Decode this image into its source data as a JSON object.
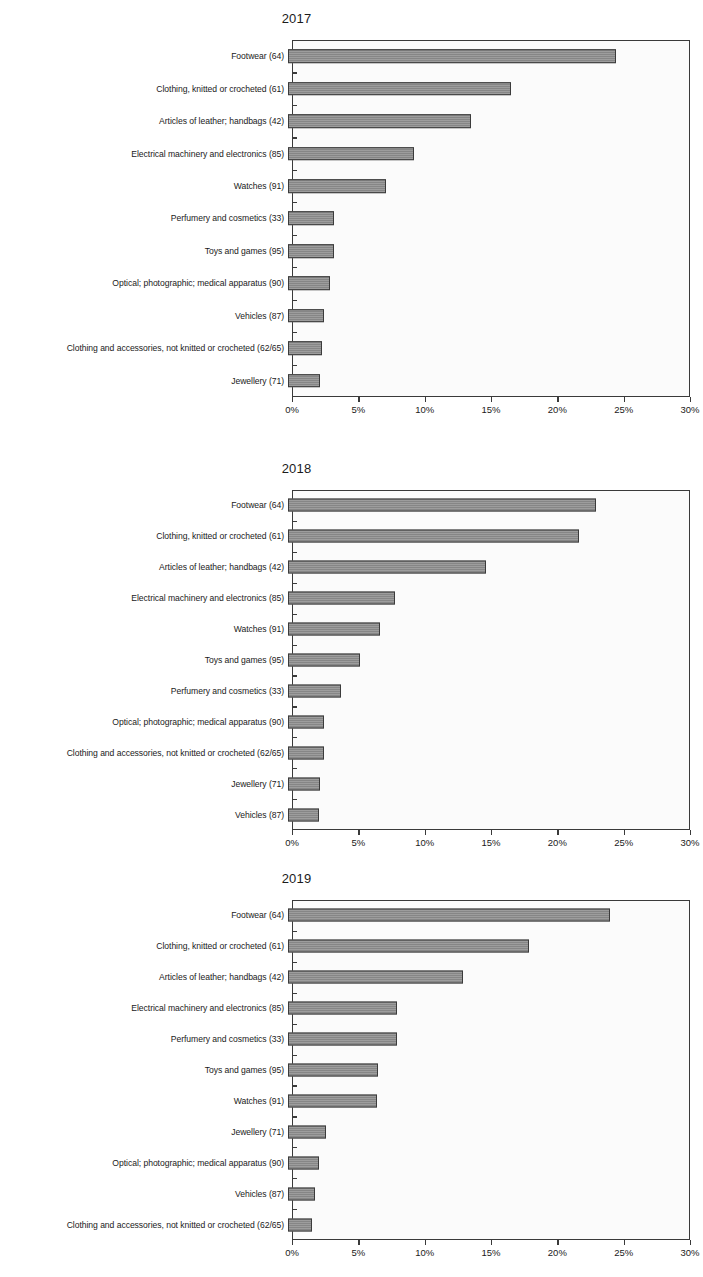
{
  "page": {
    "width": 703,
    "height": 1277,
    "background": "#ffffff",
    "bar_color": "#8d8d8d",
    "bar_border_color": "#3b3b3b",
    "axis_color": "#3a3a3a"
  },
  "axis": {
    "tick_labels": [
      "0%",
      "5%",
      "10%",
      "15%",
      "20%",
      "25%",
      "30%"
    ],
    "tick_values": [
      0,
      5,
      10,
      15,
      20,
      25,
      30
    ],
    "min": 0,
    "max": 30
  },
  "charts": [
    {
      "title": "2017",
      "categories": [
        "Footwear (64)",
        "Clothing, knitted or crocheted (61)",
        "Articles of leather; handbags (42)",
        "Electrical machinery and electronics (85)",
        "Watches (91)",
        "Perfumery and cosmetics (33)",
        "Toys and games (95)",
        "Optical; photographic; medical apparatus (90)",
        "Vehicles (87)",
        "Clothing and accessories, not knitted or crocheted (62/65)",
        "Jewellery (71)"
      ],
      "values": [
        24.7,
        16.8,
        13.8,
        9.5,
        7.4,
        3.5,
        3.5,
        3.2,
        2.7,
        2.6,
        2.4
      ]
    },
    {
      "title": "2018",
      "categories": [
        "Footwear (64)",
        "Clothing, knitted or crocheted (61)",
        "Articles of leather; handbags (42)",
        "Electrical machinery and electronics (85)",
        "Watches (91)",
        "Toys and games (95)",
        "Perfumery and cosmetics (33)",
        "Optical; photographic; medical apparatus (90)",
        "Clothing and accessories, not knitted or crocheted (62/65)",
        "Jewellery (71)",
        "Vehicles (87)"
      ],
      "values": [
        23.2,
        21.9,
        14.9,
        8.1,
        6.9,
        5.4,
        4.0,
        2.7,
        2.7,
        2.4,
        2.3
      ]
    },
    {
      "title": "2019",
      "categories": [
        "Footwear (64)",
        "Clothing, knitted or crocheted (61)",
        "Articles of leather; handbags (42)",
        "Electrical machinery and electronics (85)",
        "Perfumery and cosmetics (33)",
        "Toys and games (95)",
        "Watches (91)",
        "Jewellery (71)",
        "Optical; photographic; medical apparatus (90)",
        "Vehicles (87)",
        "Clothing and accessories, not knitted or crocheted (62/65)"
      ],
      "values": [
        24.3,
        18.2,
        13.2,
        8.2,
        8.2,
        6.8,
        6.7,
        2.9,
        2.3,
        2.0,
        1.8
      ]
    }
  ],
  "chart_data": [
    {
      "type": "bar",
      "orientation": "horizontal",
      "title": "2017",
      "xlabel": "",
      "ylabel": "",
      "xlim": [
        0,
        30
      ],
      "xticks": [
        0,
        5,
        10,
        15,
        20,
        25,
        30
      ],
      "xtick_labels": [
        "0%",
        "5%",
        "10%",
        "15%",
        "20%",
        "25%",
        "30%"
      ],
      "grid": false,
      "legend": "none",
      "categories": [
        "Footwear (64)",
        "Clothing, knitted or crocheted (61)",
        "Articles of leather; handbags (42)",
        "Electrical machinery and electronics (85)",
        "Watches (91)",
        "Perfumery and cosmetics (33)",
        "Toys and games (95)",
        "Optical; photographic; medical apparatus (90)",
        "Vehicles (87)",
        "Clothing and accessories, not knitted or crocheted (62/65)",
        "Jewellery (71)"
      ],
      "values": [
        24.7,
        16.8,
        13.8,
        9.5,
        7.4,
        3.5,
        3.5,
        3.2,
        2.7,
        2.6,
        2.4
      ]
    },
    {
      "type": "bar",
      "orientation": "horizontal",
      "title": "2018",
      "xlabel": "",
      "ylabel": "",
      "xlim": [
        0,
        30
      ],
      "xticks": [
        0,
        5,
        10,
        15,
        20,
        25,
        30
      ],
      "xtick_labels": [
        "0%",
        "5%",
        "10%",
        "15%",
        "20%",
        "25%",
        "30%"
      ],
      "grid": false,
      "legend": "none",
      "categories": [
        "Footwear (64)",
        "Clothing, knitted or crocheted (61)",
        "Articles of leather; handbags (42)",
        "Electrical machinery and electronics (85)",
        "Watches (91)",
        "Toys and games (95)",
        "Perfumery and cosmetics (33)",
        "Optical; photographic; medical apparatus (90)",
        "Clothing and accessories, not knitted or crocheted (62/65)",
        "Jewellery (71)",
        "Vehicles (87)"
      ],
      "values": [
        23.2,
        21.9,
        14.9,
        8.1,
        6.9,
        5.4,
        4.0,
        2.7,
        2.7,
        2.4,
        2.3
      ]
    },
    {
      "type": "bar",
      "orientation": "horizontal",
      "title": "2019",
      "xlabel": "",
      "ylabel": "",
      "xlim": [
        0,
        30
      ],
      "xticks": [
        0,
        5,
        10,
        15,
        20,
        25,
        30
      ],
      "xtick_labels": [
        "0%",
        "5%",
        "10%",
        "15%",
        "20%",
        "25%",
        "30%"
      ],
      "grid": false,
      "legend": "none",
      "categories": [
        "Footwear (64)",
        "Clothing, knitted or crocheted (61)",
        "Articles of leather; handbags (42)",
        "Electrical machinery and electronics (85)",
        "Perfumery and cosmetics (33)",
        "Toys and games (95)",
        "Watches (91)",
        "Jewellery (71)",
        "Optical; photographic; medical apparatus (90)",
        "Vehicles (87)",
        "Clothing and accessories, not knitted or crocheted (62/65)"
      ],
      "values": [
        24.3,
        18.2,
        13.2,
        8.2,
        8.2,
        6.8,
        6.7,
        2.9,
        2.3,
        2.0,
        1.8
      ]
    }
  ]
}
